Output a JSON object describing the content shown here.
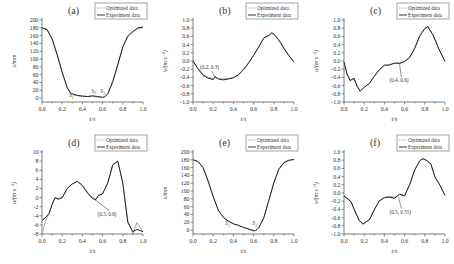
{
  "legend": {
    "optimized": "Optimized data",
    "experiment": "Experiment data"
  },
  "colors": {
    "optimized": "#9a9a9a",
    "experiment": "#222222",
    "axis": "#444444"
  },
  "chart_data": [
    {
      "id": "a",
      "label": "(a)",
      "type": "line",
      "xlabel": "t/s",
      "ylabel": "s/mm",
      "xlim": [
        0,
        1.0
      ],
      "ylim": [
        -10,
        200
      ],
      "xticks": [
        0.0,
        0.2,
        0.4,
        0.6,
        0.8,
        1.0
      ],
      "yticks": [
        0,
        20,
        40,
        60,
        80,
        100,
        120,
        140,
        160,
        180,
        200
      ],
      "x": [
        0.0,
        0.05,
        0.1,
        0.15,
        0.2,
        0.25,
        0.28,
        0.3,
        0.35,
        0.4,
        0.45,
        0.5,
        0.55,
        0.6,
        0.62,
        0.65,
        0.7,
        0.75,
        0.8,
        0.85,
        0.9,
        0.95,
        1.0
      ],
      "series": [
        {
          "name": "Optimized data",
          "values": [
            180,
            175,
            150,
            110,
            65,
            25,
            12,
            9,
            6,
            5,
            4,
            4,
            3,
            1,
            2,
            10,
            40,
            85,
            130,
            160,
            172,
            178,
            180
          ]
        },
        {
          "name": "Experiment data",
          "values": [
            180,
            176,
            152,
            112,
            66,
            26,
            14,
            11,
            7,
            5,
            4,
            6,
            4,
            2,
            3,
            11,
            42,
            86,
            131,
            158,
            170,
            180,
            182
          ]
        }
      ],
      "annotations": [
        {
          "text": "S1",
          "x": 0.27,
          "y": 2
        },
        {
          "text": "S2",
          "x": 0.49,
          "y": 14
        },
        {
          "text": "S3",
          "x": 0.58,
          "y": 12
        }
      ]
    },
    {
      "id": "b",
      "label": "(b)",
      "type": "line",
      "xlabel": "t/s",
      "ylabel": "v/(m·s⁻¹)",
      "xlim": [
        0,
        1.0
      ],
      "ylim": [
        -1.0,
        1.0
      ],
      "xticks": [
        0.0,
        0.2,
        0.4,
        0.6,
        0.8,
        1.0
      ],
      "yticks": [
        -1.0,
        -0.8,
        -0.6,
        -0.4,
        -0.2,
        0.0,
        0.2,
        0.4,
        0.6,
        0.8,
        1.0
      ],
      "x": [
        0.0,
        0.05,
        0.1,
        0.15,
        0.2,
        0.22,
        0.25,
        0.3,
        0.35,
        0.4,
        0.45,
        0.5,
        0.55,
        0.6,
        0.65,
        0.7,
        0.75,
        0.78,
        0.8,
        0.85,
        0.9,
        0.95,
        1.0
      ],
      "series": [
        {
          "name": "Optimized data",
          "values": [
            0.0,
            -0.18,
            -0.33,
            -0.4,
            -0.43,
            -0.4,
            -0.42,
            -0.44,
            -0.43,
            -0.4,
            -0.33,
            -0.2,
            -0.04,
            0.15,
            0.35,
            0.55,
            0.63,
            0.67,
            0.65,
            0.52,
            0.32,
            0.14,
            -0.02
          ]
        },
        {
          "name": "Experiment data",
          "values": [
            0.0,
            -0.19,
            -0.35,
            -0.42,
            -0.45,
            -0.38,
            -0.44,
            -0.46,
            -0.44,
            -0.41,
            -0.34,
            -0.21,
            -0.05,
            0.14,
            0.34,
            0.56,
            0.62,
            0.69,
            0.66,
            0.51,
            0.31,
            0.13,
            -0.03
          ]
        }
      ],
      "annotations": [
        {
          "text": "(0.2, 0.3)",
          "x": 0.07,
          "y": -0.2,
          "arrow_to": [
            0.22,
            -0.4
          ]
        }
      ]
    },
    {
      "id": "c",
      "label": "(c)",
      "type": "line",
      "xlabel": "t/s",
      "ylabel": "a/(m·s⁻²)",
      "xlim": [
        0,
        1.0
      ],
      "ylim": [
        -1.0,
        1.0
      ],
      "xticks": [
        0.0,
        0.2,
        0.4,
        0.6,
        0.8,
        1.0
      ],
      "yticks": [
        -1.0,
        -0.8,
        -0.6,
        -0.4,
        -0.2,
        0.0,
        0.2,
        0.4,
        0.6,
        0.8,
        1.0
      ],
      "x": [
        0.0,
        0.03,
        0.06,
        0.1,
        0.13,
        0.16,
        0.2,
        0.25,
        0.3,
        0.35,
        0.4,
        0.45,
        0.5,
        0.55,
        0.6,
        0.65,
        0.7,
        0.75,
        0.8,
        0.83,
        0.88,
        0.94,
        1.0
      ],
      "series": [
        {
          "name": "Optimized data",
          "values": [
            -0.05,
            -0.3,
            -0.45,
            -0.45,
            -0.6,
            -0.72,
            -0.65,
            -0.55,
            -0.38,
            -0.22,
            -0.12,
            -0.08,
            -0.06,
            -0.04,
            -0.02,
            0.08,
            0.3,
            0.6,
            0.8,
            0.82,
            0.65,
            0.3,
            -0.02
          ]
        },
        {
          "name": "Experiment data",
          "values": [
            -0.03,
            -0.32,
            -0.48,
            -0.42,
            -0.62,
            -0.74,
            -0.64,
            -0.55,
            -0.37,
            -0.21,
            -0.1,
            -0.1,
            -0.05,
            -0.06,
            -0.01,
            0.09,
            0.31,
            0.62,
            0.79,
            0.84,
            0.64,
            0.29,
            -0.01
          ]
        }
      ],
      "annotations": [
        {
          "text": "(0.4, 0.6)",
          "x": 0.45,
          "y": -0.52,
          "arrow_to": [
            0.55,
            -0.07
          ]
        }
      ]
    },
    {
      "id": "d",
      "label": "(d)",
      "type": "line",
      "xlabel": "t/s",
      "ylabel": "a/(m·s⁻²)",
      "xlim": [
        0,
        1.0
      ],
      "ylim": [
        -8,
        10
      ],
      "xticks": [
        0.0,
        0.2,
        0.4,
        0.6,
        0.8,
        1.0
      ],
      "yticks": [
        -8,
        -6,
        -4,
        -2,
        0,
        2,
        4,
        6,
        8,
        10
      ],
      "x": [
        0.0,
        0.03,
        0.07,
        0.1,
        0.13,
        0.16,
        0.2,
        0.25,
        0.3,
        0.35,
        0.4,
        0.45,
        0.5,
        0.53,
        0.56,
        0.6,
        0.65,
        0.7,
        0.75,
        0.8,
        0.85,
        0.9,
        0.94,
        1.0
      ],
      "series": [
        {
          "name": "Optimized data",
          "values": [
            -8.0,
            -5.5,
            -3.5,
            -1.5,
            0.0,
            -0.5,
            0.0,
            2.0,
            3.0,
            3.5,
            2.8,
            1.2,
            0.0,
            -0.3,
            0.3,
            1.0,
            3.0,
            7.0,
            8.0,
            3.0,
            -5.0,
            -8.0,
            -5.5,
            -7.5
          ]
        },
        {
          "name": "Experiment data",
          "values": [
            -5.0,
            -4.5,
            -3.5,
            -1.5,
            0.0,
            -0.3,
            0.0,
            2.0,
            3.0,
            3.6,
            2.6,
            1.0,
            -0.2,
            -0.5,
            0.5,
            0.8,
            3.2,
            7.2,
            8.0,
            3.2,
            -5.5,
            -7.5,
            -7.0,
            -7.5
          ]
        }
      ],
      "annotations": [
        {
          "text": "(0.5, 0.6)",
          "x": 0.55,
          "y": -4.0,
          "arrow_to": [
            0.52,
            -0.4
          ]
        }
      ]
    },
    {
      "id": "e",
      "label": "(e)",
      "type": "line",
      "xlabel": "t/s",
      "ylabel": "s/mm",
      "xlim": [
        0,
        1.0
      ],
      "ylim": [
        -10,
        200
      ],
      "xticks": [
        0.0,
        0.2,
        0.4,
        0.6,
        0.8,
        1.0
      ],
      "yticks": [
        0,
        20,
        40,
        60,
        80,
        100,
        120,
        140,
        160,
        180,
        200
      ],
      "x": [
        0.0,
        0.05,
        0.1,
        0.15,
        0.2,
        0.25,
        0.3,
        0.35,
        0.4,
        0.45,
        0.5,
        0.55,
        0.6,
        0.62,
        0.65,
        0.7,
        0.75,
        0.8,
        0.85,
        0.9,
        0.95,
        1.0
      ],
      "series": [
        {
          "name": "Optimized data",
          "values": [
            180,
            175,
            160,
            125,
            85,
            50,
            32,
            22,
            16,
            12,
            7,
            2,
            0,
            -1,
            5,
            30,
            75,
            120,
            155,
            172,
            178,
            180
          ]
        },
        {
          "name": "Experiment data",
          "values": [
            180,
            176,
            160,
            126,
            86,
            51,
            33,
            23,
            16,
            12,
            7,
            3,
            -2,
            -1,
            6,
            31,
            76,
            121,
            156,
            173,
            179,
            181
          ]
        }
      ],
      "annotations": [
        {
          "text": "S1",
          "x": 0.32,
          "y": 12
        },
        {
          "text": "S2",
          "x": 0.59,
          "y": 12
        }
      ]
    },
    {
      "id": "f",
      "label": "(f)",
      "type": "line",
      "xlabel": "t/s",
      "ylabel": "v/(m·s⁻¹)",
      "xlim": [
        0,
        1.0
      ],
      "ylim": [
        -1.0,
        1.0
      ],
      "xticks": [
        0.0,
        0.2,
        0.4,
        0.6,
        0.8,
        1.0
      ],
      "yticks": [
        -1.0,
        -0.8,
        -0.6,
        -0.4,
        -0.2,
        0.0,
        0.2,
        0.4,
        0.6,
        0.8,
        1.0
      ],
      "x": [
        0.0,
        0.03,
        0.07,
        0.1,
        0.15,
        0.19,
        0.22,
        0.25,
        0.3,
        0.35,
        0.4,
        0.45,
        0.5,
        0.55,
        0.6,
        0.65,
        0.7,
        0.75,
        0.78,
        0.82,
        0.86,
        0.9,
        0.95,
        1.0
      ],
      "series": [
        {
          "name": "Optimized data",
          "values": [
            -0.08,
            -0.12,
            -0.2,
            -0.38,
            -0.65,
            -0.75,
            -0.7,
            -0.65,
            -0.4,
            -0.2,
            -0.12,
            -0.08,
            -0.1,
            -0.04,
            -0.06,
            0.2,
            0.55,
            0.78,
            0.83,
            0.8,
            0.7,
            0.4,
            0.2,
            -0.05
          ]
        },
        {
          "name": "Experiment data",
          "values": [
            -0.07,
            -0.13,
            -0.22,
            -0.4,
            -0.67,
            -0.76,
            -0.7,
            -0.66,
            -0.41,
            -0.19,
            -0.11,
            -0.1,
            -0.13,
            -0.03,
            -0.07,
            0.21,
            0.56,
            0.79,
            0.84,
            0.79,
            0.71,
            0.39,
            0.19,
            -0.06
          ]
        }
      ],
      "annotations": [
        {
          "text": "(0.5, 0.55)",
          "x": 0.45,
          "y": -0.5,
          "arrow_to": [
            0.54,
            -0.1
          ]
        }
      ]
    }
  ]
}
